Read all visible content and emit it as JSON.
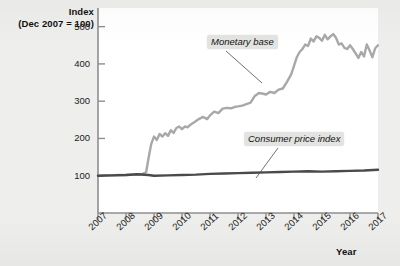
{
  "chart_data": {
    "type": "line",
    "title": "",
    "ylabel": "Index\n(Dec 2007 = 100)",
    "ylabel_line1": "Index",
    "ylabel_line2": "(Dec 2007 = 100)",
    "xlabel": "Year",
    "ylim": [
      0,
      550
    ],
    "yticks": [
      100,
      200,
      300,
      400,
      500
    ],
    "ytick_labels": [
      "100",
      "200",
      "300",
      "400",
      "500"
    ],
    "xlim": [
      2007,
      2017
    ],
    "xticks": [
      2007,
      2008,
      2009,
      2010,
      2011,
      2012,
      2013,
      2014,
      2015,
      2016,
      2017
    ],
    "xtick_labels": [
      "2007",
      "2008",
      "2009",
      "2010",
      "2011",
      "2012",
      "2013",
      "2014",
      "2015",
      "2016",
      "2017"
    ],
    "grid": false,
    "legend_position": "inline-annotations",
    "annotations": [
      {
        "name": "monetary-base",
        "text": "Monetary base",
        "x": 2012.1,
        "y": 470
      },
      {
        "name": "consumer-price-index",
        "text": "Consumer price index",
        "x": 2013.4,
        "y": 225
      }
    ],
    "series": [
      {
        "name": "Monetary base",
        "color": "#a8a8a8",
        "width": 2.4,
        "x": [
          2007.0,
          2007.25,
          2007.5,
          2007.75,
          2008.0,
          2008.25,
          2008.5,
          2008.6,
          2008.72,
          2008.8,
          2008.9,
          2009.0,
          2009.1,
          2009.2,
          2009.3,
          2009.4,
          2009.5,
          2009.6,
          2009.7,
          2009.8,
          2009.9,
          2010.0,
          2010.1,
          2010.2,
          2010.3,
          2010.45,
          2010.6,
          2010.75,
          2010.9,
          2011.0,
          2011.15,
          2011.3,
          2011.45,
          2011.6,
          2011.75,
          2011.9,
          2012.0,
          2012.15,
          2012.3,
          2012.45,
          2012.6,
          2012.75,
          2012.9,
          2013.0,
          2013.15,
          2013.3,
          2013.45,
          2013.6,
          2013.75,
          2013.9,
          2014.0,
          2014.1,
          2014.2,
          2014.3,
          2014.4,
          2014.5,
          2014.6,
          2014.7,
          2014.8,
          2014.9,
          2015.0,
          2015.1,
          2015.2,
          2015.3,
          2015.4,
          2015.5,
          2015.6,
          2015.7,
          2015.8,
          2015.9,
          2016.0,
          2016.1,
          2016.2,
          2016.3,
          2016.4,
          2016.5,
          2016.6,
          2016.7,
          2016.8,
          2016.9,
          2017.0
        ],
        "values": [
          100,
          101,
          101,
          102,
          102,
          103,
          104,
          105,
          110,
          145,
          185,
          205,
          196,
          212,
          205,
          214,
          207,
          222,
          215,
          228,
          232,
          225,
          232,
          230,
          237,
          244,
          252,
          258,
          252,
          262,
          272,
          268,
          280,
          282,
          281,
          285,
          286,
          288,
          292,
          296,
          314,
          322,
          320,
          318,
          325,
          322,
          331,
          334,
          352,
          372,
          395,
          418,
          432,
          440,
          452,
          448,
          468,
          460,
          474,
          470,
          462,
          478,
          466,
          474,
          480,
          470,
          452,
          455,
          443,
          440,
          450,
          440,
          428,
          416,
          432,
          420,
          452,
          436,
          418,
          442,
          450
        ]
      },
      {
        "name": "Consumer price index",
        "color": "#4a4a4a",
        "width": 2.4,
        "x": [
          2007.0,
          2007.5,
          2008.0,
          2008.4,
          2008.8,
          2009.0,
          2009.5,
          2010.0,
          2010.5,
          2011.0,
          2011.5,
          2012.0,
          2012.5,
          2013.0,
          2013.5,
          2014.0,
          2014.5,
          2015.0,
          2015.5,
          2016.0,
          2016.5,
          2017.0
        ],
        "values": [
          100,
          101,
          102,
          104,
          102,
          100,
          101,
          102,
          103,
          105,
          106,
          107,
          108,
          109,
          110,
          111,
          112,
          111,
          112,
          113,
          114,
          116
        ]
      }
    ]
  },
  "axes": {
    "y_title_line1": "Index",
    "y_title_line2": "(Dec 2007 = 100)",
    "x_title": "Year"
  }
}
